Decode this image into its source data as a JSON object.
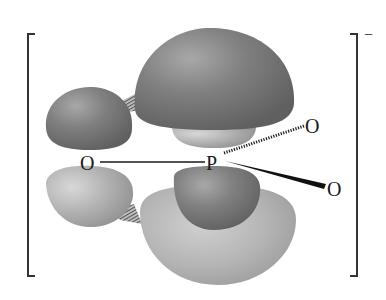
{
  "diagram": {
    "type": "molecular-orbital",
    "charge": "−",
    "atoms": {
      "left_oxygen": "O",
      "phosphorus": "P",
      "upper_right_oxygen": "O",
      "lower_right_oxygen": "O"
    },
    "bonds": [
      {
        "from": "left_oxygen",
        "to": "phosphorus",
        "style": "plain line"
      },
      {
        "from": "phosphorus",
        "to": "upper_right_oxygen",
        "style": "hashed wedge (behind plane)"
      },
      {
        "from": "phosphorus",
        "to": "lower_right_oxygen",
        "style": "solid wedge (toward viewer)"
      }
    ],
    "lobes": [
      {
        "name": "O p-orbital upper lobe",
        "shade": "dark"
      },
      {
        "name": "O p-orbital lower lobe",
        "shade": "light"
      },
      {
        "name": "P d-orbital upper large lobe",
        "shade": "dark"
      },
      {
        "name": "P d-orbital upper small lobe",
        "shade": "light"
      },
      {
        "name": "P d-orbital lower small lobe",
        "shade": "dark"
      },
      {
        "name": "P d-orbital lower large lobe",
        "shade": "light"
      }
    ],
    "overlap_marks": [
      "upper overlap hatching",
      "lower overlap hatching"
    ],
    "colors": {
      "dark_lobe": "#7a7a7a",
      "light_lobe": "#b4b4b4",
      "bracket": "#333333",
      "text": "#1a1a1a"
    }
  }
}
